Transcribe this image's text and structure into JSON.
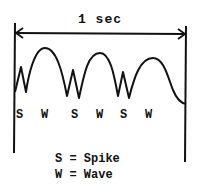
{
  "diagram": {
    "duration_label": "1 sec",
    "sequence_labels": [
      {
        "text": "S",
        "x": 16
      },
      {
        "text": "W",
        "x": 41
      },
      {
        "text": "S",
        "x": 71
      },
      {
        "text": "W",
        "x": 96
      },
      {
        "text": "S",
        "x": 120
      },
      {
        "text": "W",
        "x": 145
      }
    ],
    "legend": [
      {
        "text": "S = Spike"
      },
      {
        "text": "W = Wave"
      }
    ],
    "stroke_color": "#111111",
    "background": "#ffffff"
  }
}
